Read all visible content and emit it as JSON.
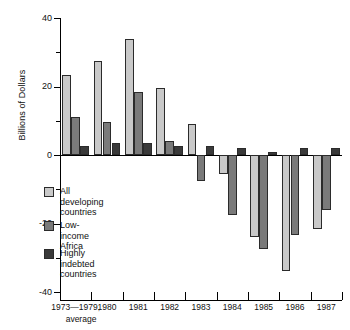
{
  "chart_data": {
    "type": "bar",
    "title": "",
    "subtitle": "",
    "xlabel": "",
    "ylabel": "Billions of Dollars",
    "ylim": [
      -40,
      40
    ],
    "yticks": [
      40,
      20,
      0,
      -20,
      -40
    ],
    "ytick_labels": [
      "40",
      "20",
      "0",
      "-20",
      "-40"
    ],
    "yminor_ticks": [
      30,
      10,
      -10,
      -30
    ],
    "grid": false,
    "legend_position": "inside-left",
    "categories": [
      "1973—1979,\naverage",
      "1980",
      "1981",
      "1982",
      "1983",
      "1984",
      "1985",
      "1986",
      "1987"
    ],
    "category_labels": [
      "1973—1979,",
      "1980",
      "1981",
      "1982",
      "1983",
      "1984",
      "1985",
      "1986",
      "1987"
    ],
    "category_sublabel": "average",
    "series": [
      {
        "name": "All developing countries",
        "color": "#c9c9c9",
        "values": [
          23.5,
          27.5,
          34.0,
          19.5,
          9.0,
          -5.5,
          -24.0,
          -34.0,
          -21.5
        ]
      },
      {
        "name": "Low-income Africa",
        "color": "#7a7a7a",
        "values": [
          11.0,
          9.5,
          18.5,
          4.0,
          -7.5,
          -17.5,
          -27.5,
          -23.5,
          -16.0
        ]
      },
      {
        "name": "Highly indebted countries",
        "color": "#3a3a3a",
        "values": [
          2.5,
          3.5,
          3.5,
          2.5,
          2.5,
          2.0,
          1.0,
          2.0,
          2.0
        ]
      }
    ]
  },
  "legend": {
    "items": [
      {
        "label": "All developing\ncountries",
        "color": "#c9c9c9"
      },
      {
        "label": "Low-income Africa",
        "color": "#7a7a7a"
      },
      {
        "label": "Highly indebted\ncountries",
        "color": "#3a3a3a"
      }
    ]
  }
}
